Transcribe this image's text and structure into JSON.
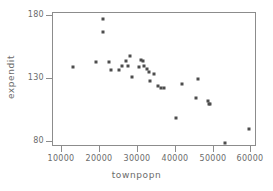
{
  "chart_data": {
    "type": "scatter",
    "title": "",
    "xlabel": "townpopn",
    "ylabel": "expendit",
    "xlim": [
      7500,
      61500
    ],
    "ylim": [
      76,
      182
    ],
    "xticks": [
      10000,
      20000,
      30000,
      40000,
      50000,
      60000
    ],
    "yticks": [
      80,
      130,
      180
    ],
    "xtick_labels": [
      "10000",
      "20000",
      "30000",
      "40000",
      "50000",
      "60000"
    ],
    "ytick_labels": [
      "80",
      "130",
      "180"
    ],
    "grid": false,
    "legend": null,
    "marker": "square",
    "marker_color": "#4d4d4d",
    "frame_color": "#8c8c8c",
    "points": [
      {
        "x": 12900,
        "y": 139
      },
      {
        "x": 18900,
        "y": 143
      },
      {
        "x": 20700,
        "y": 177
      },
      {
        "x": 20700,
        "y": 167
      },
      {
        "x": 22300,
        "y": 143
      },
      {
        "x": 22900,
        "y": 137
      },
      {
        "x": 25000,
        "y": 137
      },
      {
        "x": 25800,
        "y": 140
      },
      {
        "x": 26900,
        "y": 144
      },
      {
        "x": 27400,
        "y": 140
      },
      {
        "x": 27900,
        "y": 148
      },
      {
        "x": 28400,
        "y": 131
      },
      {
        "x": 30200,
        "y": 139
      },
      {
        "x": 30800,
        "y": 145
      },
      {
        "x": 31400,
        "y": 144
      },
      {
        "x": 31700,
        "y": 140
      },
      {
        "x": 32300,
        "y": 138
      },
      {
        "x": 32900,
        "y": 135
      },
      {
        "x": 33100,
        "y": 128
      },
      {
        "x": 34200,
        "y": 134
      },
      {
        "x": 35400,
        "y": 124
      },
      {
        "x": 36000,
        "y": 123
      },
      {
        "x": 36800,
        "y": 123
      },
      {
        "x": 40000,
        "y": 99
      },
      {
        "x": 41700,
        "y": 126
      },
      {
        "x": 45400,
        "y": 115
      },
      {
        "x": 45900,
        "y": 130
      },
      {
        "x": 48400,
        "y": 112
      },
      {
        "x": 48800,
        "y": 110
      },
      {
        "x": 49000,
        "y": 110
      },
      {
        "x": 52900,
        "y": 79
      },
      {
        "x": 59300,
        "y": 90
      }
    ]
  }
}
